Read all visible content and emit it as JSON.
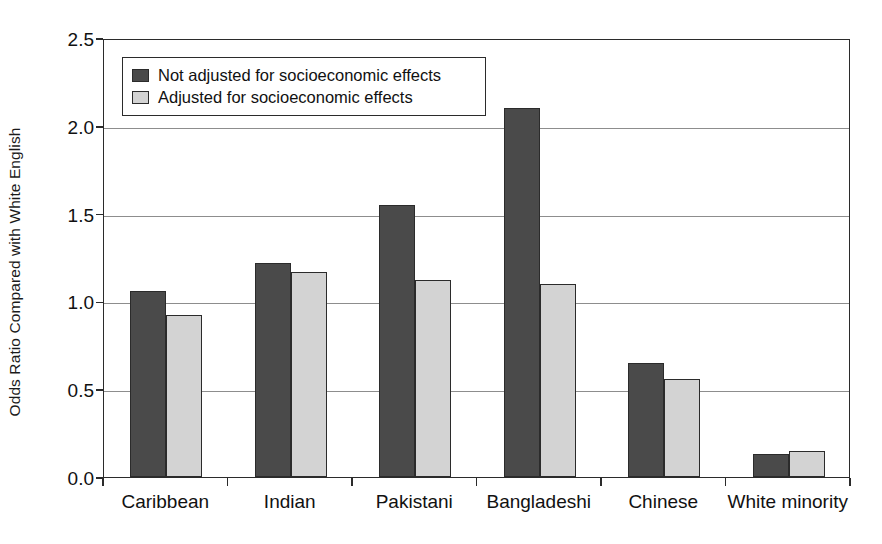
{
  "chart_data": {
    "type": "bar",
    "title": "",
    "xlabel": "",
    "ylabel": "Odds Ratio Compared with White English",
    "categories": [
      "Caribbean",
      "Indian",
      "Pakistani",
      "Bangladeshi",
      "Chinese",
      "White minority"
    ],
    "series": [
      {
        "name": "Not adjusted for socioeconomic effects",
        "color": "#4a4a4a",
        "values": [
          1.06,
          1.22,
          1.55,
          2.1,
          0.65,
          0.13
        ]
      },
      {
        "name": "Adjusted for socioeconomic effects",
        "color": "#d3d3d3",
        "values": [
          0.92,
          1.17,
          1.12,
          1.1,
          0.56,
          0.15
        ]
      }
    ],
    "ylim": [
      0.0,
      2.5
    ],
    "yticks": [
      "0.0",
      "0.5",
      "1.0",
      "1.5",
      "2.0",
      "2.5"
    ],
    "ytick_values": [
      0.0,
      0.5,
      1.0,
      1.5,
      2.0,
      2.5
    ],
    "grid": true,
    "grid_axis": "y",
    "legend_position": "top-left"
  },
  "legend": {
    "items": [
      {
        "label": "Not adjusted for socioeconomic effects",
        "swatch": "dark"
      },
      {
        "label": "Adjusted for socioeconomic effects",
        "swatch": "light"
      }
    ]
  },
  "axes": {
    "y_title": "Odds Ratio Compared with White English"
  }
}
